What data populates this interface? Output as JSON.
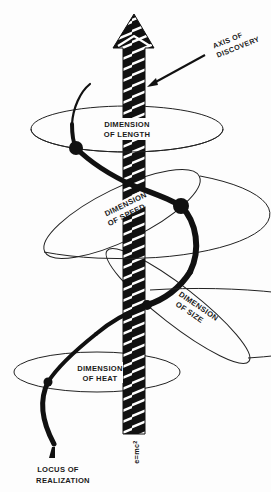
{
  "diagram": {
    "title": "",
    "colors": {
      "ink": "#111111",
      "background": "#fdfdfd",
      "stripe": "#ffffff"
    },
    "axis": {
      "label_line1": "AXIS OF",
      "label_line2": "DISCOVERY",
      "equation": "e=mc",
      "equation_exponent": "2"
    },
    "locus": {
      "label_line1": "LOCUS OF",
      "label_line2": "REALIZATION"
    },
    "dimensions": [
      {
        "id": "length",
        "line1": "DIMENSION",
        "line2": "OF LENGTH"
      },
      {
        "id": "speed",
        "line1": "DIMENSION",
        "line2": "OF SPEED"
      },
      {
        "id": "size",
        "line1": "DIMENSION",
        "line2": "OF SIZE"
      },
      {
        "id": "heat",
        "line1": "DIMENSION",
        "line2": "OF HEAT"
      }
    ],
    "nodes": [
      {
        "id": "length-node",
        "x": 76,
        "y": 148
      },
      {
        "id": "speed-node",
        "x": 181,
        "y": 206
      },
      {
        "id": "size-node",
        "x": 147,
        "y": 305
      },
      {
        "id": "heat-node",
        "x": 48,
        "y": 382
      }
    ]
  }
}
